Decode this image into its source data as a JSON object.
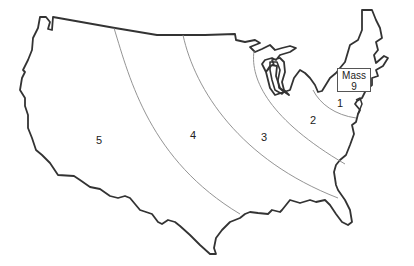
{
  "map": {
    "subject": "Contiguous United States",
    "zones": [
      {
        "id": 1,
        "label": "1",
        "x": 340,
        "y": 103
      },
      {
        "id": 2,
        "label": "2",
        "x": 313,
        "y": 120
      },
      {
        "id": 3,
        "label": "3",
        "x": 264,
        "y": 137
      },
      {
        "id": 4,
        "label": "4",
        "x": 193,
        "y": 135
      },
      {
        "id": 5,
        "label": "5",
        "x": 99,
        "y": 140
      }
    ],
    "callout": {
      "name": "Mass",
      "value": "9"
    },
    "colors": {
      "outline": "#333333",
      "zone_lines": "#888888",
      "background": "#ffffff"
    }
  }
}
